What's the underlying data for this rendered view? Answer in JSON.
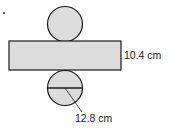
{
  "figure": {
    "type": "cylinder-net",
    "colors": {
      "fill": "#dcdcdc",
      "stroke": "#1a1a1a",
      "background": "#ffffff"
    },
    "top_circle": {
      "cx": 65,
      "cy": 24,
      "r": 17.5
    },
    "rectangle": {
      "x": 9,
      "y": 41,
      "width": 112,
      "height": 29
    },
    "bottom_circle": {
      "cx": 65,
      "cy": 88,
      "r": 17.5
    },
    "diameter_line": {
      "x1": 47.5,
      "y1": 88,
      "x2": 82.5,
      "y2": 88
    },
    "leader_line": {
      "x1": 65,
      "y1": 88,
      "x2": 82,
      "y2": 112
    }
  },
  "labels": {
    "height": "10.4 cm",
    "diameter": "12.8 cm"
  }
}
